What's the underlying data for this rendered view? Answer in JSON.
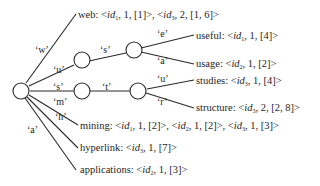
{
  "trie": {
    "edge_labels": {
      "w": "‘w’",
      "u": "‘u’",
      "s": "‘s’",
      "m": "‘m’",
      "h": "‘h’",
      "a": "‘a’",
      "us_s": "‘s’",
      "st_t": "‘t’",
      "use_e": "‘e’",
      "usa_a": "‘a’",
      "stu_u": "‘u’",
      "str_r": "‘r’"
    },
    "terms": [
      {
        "word": "web",
        "postings": [
          {
            "id": "1",
            "tf": "1",
            "pos": "[1]"
          },
          {
            "id": "3",
            "tf": "2",
            "pos": "[1, 6]"
          }
        ]
      },
      {
        "word": "useful",
        "postings": [
          {
            "id": "1",
            "tf": "1",
            "pos": "[4]"
          }
        ]
      },
      {
        "word": "usage",
        "postings": [
          {
            "id": "2",
            "tf": "1",
            "pos": "[2]"
          }
        ]
      },
      {
        "word": "studies",
        "postings": [
          {
            "id": "3",
            "tf": "1",
            "pos": "[4]"
          }
        ]
      },
      {
        "word": "structure",
        "postings": [
          {
            "id": "3",
            "tf": "2",
            "pos": "[2, 8]"
          }
        ]
      },
      {
        "word": "mining",
        "postings": [
          {
            "id": "1",
            "tf": "1",
            "pos": "[2]"
          },
          {
            "id": "2",
            "tf": "1",
            "pos": "[2]"
          },
          {
            "id": "3",
            "tf": "1",
            "pos": "[3]"
          }
        ]
      },
      {
        "word": "hyperlink",
        "postings": [
          {
            "id": "3",
            "tf": "1",
            "pos": "[7]"
          }
        ]
      },
      {
        "word": "applications",
        "postings": [
          {
            "id": "2",
            "tf": "1",
            "pos": "[3]"
          }
        ]
      }
    ],
    "id_prefix": "id"
  }
}
